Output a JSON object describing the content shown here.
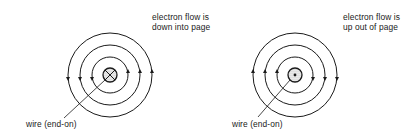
{
  "diagrams": [
    {
      "id": "left",
      "flow_label_line1": "electron flow is",
      "flow_label_line2": "down into page",
      "wire_label": "wire (end-on)",
      "wire_symbol": "cross (current into page)",
      "field_direction": "counterclockwise",
      "field_lines": 3
    },
    {
      "id": "right",
      "flow_label_line1": "electron flow is",
      "flow_label_line2": "up out of page",
      "wire_label": "wire (end-on)",
      "wire_symbol": "dot (current out of page)",
      "field_direction": "clockwise",
      "field_lines": 3
    }
  ],
  "colors": {
    "line": "#1a1a1a",
    "background": "#ffffff",
    "wire_fill": "#d0d0d0"
  }
}
